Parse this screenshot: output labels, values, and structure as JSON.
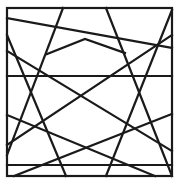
{
  "figure": {
    "width": 179,
    "height": 193,
    "background": "#ffffff",
    "stroke_color": "#1a1a1a",
    "stroke_width": 2.2,
    "frame": {
      "x": 7,
      "y": 8,
      "width": 165,
      "height": 168
    },
    "lines": [
      {
        "name": "horizontal-upper",
        "x1": 7,
        "y1": 76,
        "x2": 172,
        "y2": 76
      },
      {
        "name": "horizontal-lower",
        "x1": 7,
        "y1": 165,
        "x2": 172,
        "y2": 165
      },
      {
        "name": "diag-top-shallow",
        "x1": 7,
        "y1": 18,
        "x2": 172,
        "y2": 48
      },
      {
        "name": "diag-left-a",
        "x1": 63,
        "y1": 8,
        "x2": 7,
        "y2": 155
      },
      {
        "name": "diag-left-b",
        "x1": 7,
        "y1": 35,
        "x2": 66,
        "y2": 176
      },
      {
        "name": "diag-right-a",
        "x1": 106,
        "y1": 8,
        "x2": 172,
        "y2": 176
      },
      {
        "name": "diag-right-b",
        "x1": 172,
        "y1": 10,
        "x2": 106,
        "y2": 176
      },
      {
        "name": "diag-long-up",
        "x1": 7,
        "y1": 145,
        "x2": 172,
        "y2": 35
      },
      {
        "name": "diag-long-down",
        "x1": 7,
        "y1": 51,
        "x2": 172,
        "y2": 151
      },
      {
        "name": "diag-bottom-up",
        "x1": 14,
        "y1": 176,
        "x2": 172,
        "y2": 114
      },
      {
        "name": "diag-bottom-down",
        "x1": 7,
        "y1": 115,
        "x2": 155,
        "y2": 176
      }
    ],
    "polylines": [
      {
        "name": "chevron",
        "points": "47,54 85,39 125,53"
      }
    ]
  }
}
